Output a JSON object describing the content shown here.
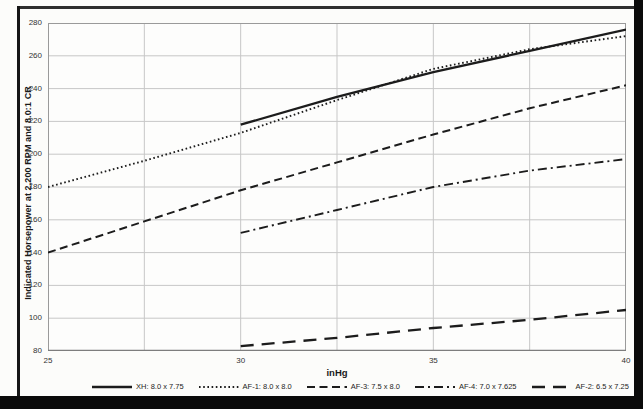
{
  "chart_data": {
    "type": "line",
    "title": "",
    "xlabel": "inHg",
    "ylabel": "Indicated Horsepower at 2,200 RPM and 8.0:1 CR",
    "xlim": [
      25,
      40
    ],
    "ylim": [
      80,
      280
    ],
    "x_major_ticks": [
      25,
      30,
      35,
      40
    ],
    "x_minor_grid_step": 2.5,
    "y_ticks": [
      80,
      100,
      120,
      140,
      160,
      180,
      200,
      220,
      240,
      260,
      280
    ],
    "grid": true,
    "legend_position": "bottom",
    "line_color": "#1c1c1c",
    "grid_color": "#c7c7c7",
    "border_color": "#9a9a9a",
    "series": [
      {
        "name": "XH: 8.0 x 7.75",
        "dash": "solid",
        "x": [
          30,
          32.5,
          35,
          37.5,
          40
        ],
        "values": [
          218,
          235,
          250,
          263,
          276
        ]
      },
      {
        "name": "AF-1: 8.0 x 8.0",
        "dash": "dotted",
        "x": [
          25,
          27.5,
          30,
          32.5,
          35,
          37.5,
          40
        ],
        "values": [
          180,
          196,
          213,
          233,
          252,
          264,
          272
        ]
      },
      {
        "name": "AF-3: 7.5 x 8.0",
        "dash": "dashed",
        "x": [
          25,
          27.5,
          30,
          32.5,
          35,
          37.5,
          40
        ],
        "values": [
          140,
          159,
          178,
          195,
          212,
          228,
          242
        ]
      },
      {
        "name": "AF-4: 7.0 x 7.625",
        "dash": "dashdot",
        "x": [
          30,
          32.5,
          35,
          37.5,
          40
        ],
        "values": [
          152,
          166,
          180,
          190,
          197
        ]
      },
      {
        "name": "AF-2: 6.5 x 7.25",
        "dash": "longdash",
        "x": [
          30,
          32.5,
          35,
          37.5,
          40
        ],
        "values": [
          83,
          88,
          94,
          99,
          105
        ]
      }
    ]
  }
}
